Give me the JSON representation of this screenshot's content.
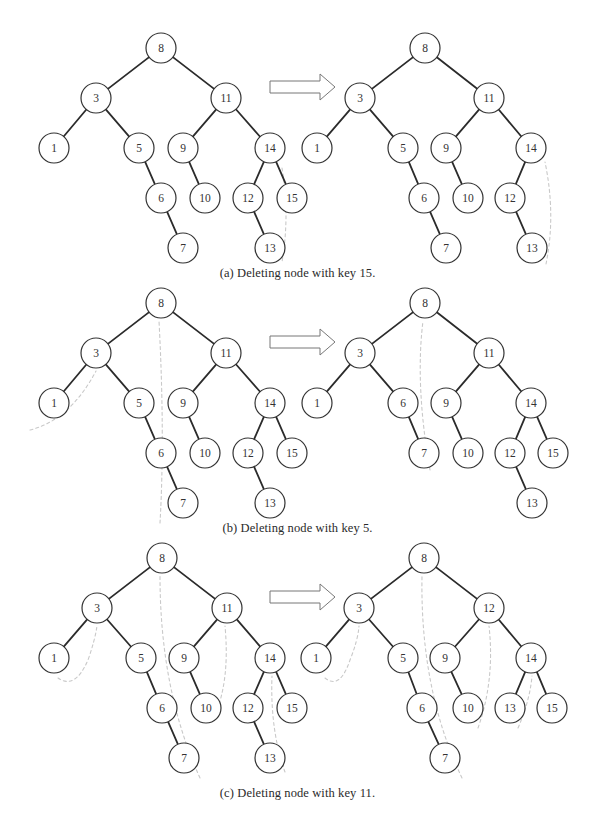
{
  "figure": {
    "colors": {
      "edge": "#2b2b2b",
      "node_stroke": "#333333",
      "node_fill": "#ffffff",
      "label": "#333333",
      "trace": "#c9c9c9",
      "arrow_stroke": "#777777"
    },
    "node_radius": 15
  },
  "panels": [
    {
      "id": "a",
      "caption": "(a) Deleting node with key 15.",
      "caption_y": 273,
      "y_offset": 0,
      "before": {
        "nodes": [
          {
            "key": "8",
            "x": 161,
            "y": 48
          },
          {
            "key": "3",
            "x": 96,
            "y": 98
          },
          {
            "key": "11",
            "x": 226,
            "y": 98
          },
          {
            "key": "1",
            "x": 54,
            "y": 148
          },
          {
            "key": "5",
            "x": 139,
            "y": 148
          },
          {
            "key": "9",
            "x": 183,
            "y": 148
          },
          {
            "key": "14",
            "x": 270,
            "y": 148
          },
          {
            "key": "6",
            "x": 161,
            "y": 198
          },
          {
            "key": "10",
            "x": 205,
            "y": 198
          },
          {
            "key": "12",
            "x": 248,
            "y": 198
          },
          {
            "key": "15",
            "x": 292,
            "y": 198
          },
          {
            "key": "7",
            "x": 183,
            "y": 248
          },
          {
            "key": "13",
            "x": 270,
            "y": 248
          }
        ],
        "edges": [
          [
            "8",
            "3"
          ],
          [
            "8",
            "11"
          ],
          [
            "3",
            "1"
          ],
          [
            "3",
            "5"
          ],
          [
            "5",
            "6"
          ],
          [
            "6",
            "7"
          ],
          [
            "11",
            "9"
          ],
          [
            "11",
            "14"
          ],
          [
            "9",
            "10"
          ],
          [
            "14",
            "12"
          ],
          [
            "14",
            "15"
          ],
          [
            "12",
            "13"
          ]
        ]
      },
      "after": {
        "nodes": [
          {
            "key": "8",
            "x": 425,
            "y": 48
          },
          {
            "key": "3",
            "x": 360,
            "y": 98
          },
          {
            "key": "11",
            "x": 489,
            "y": 98
          },
          {
            "key": "1",
            "x": 317,
            "y": 148
          },
          {
            "key": "5",
            "x": 403,
            "y": 148
          },
          {
            "key": "9",
            "x": 446,
            "y": 148
          },
          {
            "key": "14",
            "x": 531,
            "y": 148
          },
          {
            "key": "6",
            "x": 424,
            "y": 198
          },
          {
            "key": "10",
            "x": 468,
            "y": 198
          },
          {
            "key": "12",
            "x": 510,
            "y": 198
          },
          {
            "key": "7",
            "x": 446,
            "y": 248
          },
          {
            "key": "13",
            "x": 532,
            "y": 248
          }
        ],
        "edges": [
          [
            "8",
            "3"
          ],
          [
            "8",
            "11"
          ],
          [
            "3",
            "1"
          ],
          [
            "3",
            "5"
          ],
          [
            "5",
            "6"
          ],
          [
            "6",
            "7"
          ],
          [
            "11",
            "9"
          ],
          [
            "11",
            "14"
          ],
          [
            "9",
            "10"
          ],
          [
            "14",
            "12"
          ],
          [
            "12",
            "13"
          ]
        ]
      },
      "traces": [
        {
          "side": "before",
          "d": "M 282 168 Q 290 215 282 262"
        },
        {
          "side": "after",
          "d": "M 546 264 Q 556 215 545 162"
        }
      ]
    },
    {
      "id": "b",
      "caption": "(b) Deleting node with key 5.",
      "caption_y": 528,
      "y_offset": 255,
      "before": {
        "nodes": [
          {
            "key": "8",
            "x": 161,
            "y": 48
          },
          {
            "key": "3",
            "x": 96,
            "y": 98
          },
          {
            "key": "11",
            "x": 226,
            "y": 98
          },
          {
            "key": "1",
            "x": 54,
            "y": 148
          },
          {
            "key": "5",
            "x": 139,
            "y": 148
          },
          {
            "key": "9",
            "x": 183,
            "y": 148
          },
          {
            "key": "14",
            "x": 270,
            "y": 148
          },
          {
            "key": "6",
            "x": 161,
            "y": 198
          },
          {
            "key": "10",
            "x": 205,
            "y": 198
          },
          {
            "key": "12",
            "x": 248,
            "y": 198
          },
          {
            "key": "15",
            "x": 292,
            "y": 198
          },
          {
            "key": "7",
            "x": 183,
            "y": 248
          },
          {
            "key": "13",
            "x": 270,
            "y": 248
          }
        ],
        "edges": [
          [
            "8",
            "3"
          ],
          [
            "8",
            "11"
          ],
          [
            "3",
            "1"
          ],
          [
            "3",
            "5"
          ],
          [
            "5",
            "6"
          ],
          [
            "6",
            "7"
          ],
          [
            "11",
            "9"
          ],
          [
            "11",
            "14"
          ],
          [
            "9",
            "10"
          ],
          [
            "14",
            "12"
          ],
          [
            "14",
            "15"
          ],
          [
            "12",
            "13"
          ]
        ]
      },
      "after": {
        "nodes": [
          {
            "key": "8",
            "x": 425,
            "y": 48
          },
          {
            "key": "3",
            "x": 360,
            "y": 98
          },
          {
            "key": "11",
            "x": 489,
            "y": 98
          },
          {
            "key": "1",
            "x": 317,
            "y": 148
          },
          {
            "key": "6",
            "x": 403,
            "y": 148
          },
          {
            "key": "9",
            "x": 446,
            "y": 148
          },
          {
            "key": "14",
            "x": 531,
            "y": 148
          },
          {
            "key": "7",
            "x": 424,
            "y": 198
          },
          {
            "key": "10",
            "x": 468,
            "y": 198
          },
          {
            "key": "12",
            "x": 510,
            "y": 198
          },
          {
            "key": "15",
            "x": 553,
            "y": 198
          },
          {
            "key": "13",
            "x": 532,
            "y": 248
          }
        ],
        "edges": [
          [
            "8",
            "3"
          ],
          [
            "8",
            "11"
          ],
          [
            "3",
            "1"
          ],
          [
            "3",
            "6"
          ],
          [
            "6",
            "7"
          ],
          [
            "11",
            "9"
          ],
          [
            "11",
            "14"
          ],
          [
            "9",
            "10"
          ],
          [
            "14",
            "12"
          ],
          [
            "14",
            "15"
          ],
          [
            "12",
            "13"
          ]
        ]
      },
      "traces": [
        {
          "side": "before",
          "d": "M 30 175 Q 70 165 96 116"
        },
        {
          "side": "before",
          "d": "M 160 268 Q 165 180 159 66"
        },
        {
          "side": "after",
          "d": "M 430 215 Q 415 130 423 66"
        }
      ]
    },
    {
      "id": "c",
      "caption": "(c) Deleting node with key 11.",
      "caption_y": 793,
      "y_offset": 510,
      "before": {
        "nodes": [
          {
            "key": "8",
            "x": 162,
            "y": 48
          },
          {
            "key": "3",
            "x": 97,
            "y": 98
          },
          {
            "key": "11",
            "x": 227,
            "y": 98
          },
          {
            "key": "1",
            "x": 54,
            "y": 148
          },
          {
            "key": "5",
            "x": 141,
            "y": 148
          },
          {
            "key": "9",
            "x": 184,
            "y": 148
          },
          {
            "key": "14",
            "x": 270,
            "y": 148
          },
          {
            "key": "6",
            "x": 162,
            "y": 198
          },
          {
            "key": "10",
            "x": 206,
            "y": 198
          },
          {
            "key": "12",
            "x": 248,
            "y": 198
          },
          {
            "key": "15",
            "x": 292,
            "y": 198
          },
          {
            "key": "7",
            "x": 184,
            "y": 248
          },
          {
            "key": "13",
            "x": 270,
            "y": 248
          }
        ],
        "edges": [
          [
            "8",
            "3"
          ],
          [
            "8",
            "11"
          ],
          [
            "3",
            "1"
          ],
          [
            "3",
            "5"
          ],
          [
            "5",
            "6"
          ],
          [
            "6",
            "7"
          ],
          [
            "11",
            "9"
          ],
          [
            "11",
            "14"
          ],
          [
            "9",
            "10"
          ],
          [
            "14",
            "12"
          ],
          [
            "14",
            "15"
          ],
          [
            "12",
            "13"
          ]
        ]
      },
      "after": {
        "nodes": [
          {
            "key": "8",
            "x": 424,
            "y": 48
          },
          {
            "key": "3",
            "x": 359,
            "y": 98
          },
          {
            "key": "12",
            "x": 489,
            "y": 98
          },
          {
            "key": "1",
            "x": 316,
            "y": 148
          },
          {
            "key": "5",
            "x": 403,
            "y": 148
          },
          {
            "key": "9",
            "x": 445,
            "y": 148
          },
          {
            "key": "14",
            "x": 531,
            "y": 148
          },
          {
            "key": "6",
            "x": 422,
            "y": 198
          },
          {
            "key": "10",
            "x": 468,
            "y": 198
          },
          {
            "key": "13",
            "x": 510,
            "y": 198
          },
          {
            "key": "15",
            "x": 552,
            "y": 198
          },
          {
            "key": "7",
            "x": 445,
            "y": 248
          }
        ],
        "edges": [
          [
            "8",
            "3"
          ],
          [
            "8",
            "12"
          ],
          [
            "3",
            "1"
          ],
          [
            "3",
            "5"
          ],
          [
            "5",
            "6"
          ],
          [
            "6",
            "7"
          ],
          [
            "12",
            "9"
          ],
          [
            "12",
            "14"
          ],
          [
            "9",
            "10"
          ],
          [
            "14",
            "13"
          ],
          [
            "14",
            "15"
          ]
        ]
      },
      "traces": [
        {
          "side": "before",
          "d": "M 58 168 Q 75 180 88 150 Q 95 130 97 116"
        },
        {
          "side": "before",
          "d": "M 200 268 Q 160 180 160 66"
        },
        {
          "side": "before",
          "d": "M 215 205 Q 230 170 225 116"
        },
        {
          "side": "before",
          "d": "M 285 262 Q 270 220 272 166"
        },
        {
          "side": "after",
          "d": "M 325 168 Q 340 180 350 150 Q 358 130 359 116"
        },
        {
          "side": "after",
          "d": "M 462 268 Q 420 180 422 66"
        },
        {
          "side": "after",
          "d": "M 478 218 Q 495 170 489 116"
        },
        {
          "side": "after",
          "d": "M 518 218 Q 530 190 532 166"
        }
      ]
    }
  ],
  "transform_arrow": {
    "icon": "right-arrow-icon",
    "x": 270,
    "y_center": 87,
    "shaft_length": 50,
    "shaft_height": 12,
    "head_length": 15,
    "head_height": 26
  }
}
